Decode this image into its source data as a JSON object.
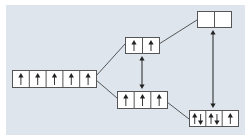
{
  "diagram": {
    "title": "",
    "colors": {
      "background": "#dfe5ec",
      "box_fill": "#ffffff",
      "stroke": "#555555",
      "arrow": "#222222"
    },
    "levels": [
      {
        "id": "free-ion",
        "x": 12,
        "y": 70,
        "w": 84,
        "h": 17,
        "cells": [
          "up",
          "up",
          "up",
          "up",
          "up"
        ]
      },
      {
        "id": "upper-middle",
        "x": 125,
        "y": 37,
        "w": 34,
        "h": 16,
        "cells": [
          "up",
          "up"
        ]
      },
      {
        "id": "lower-middle",
        "x": 117,
        "y": 91,
        "w": 50,
        "h": 17,
        "cells": [
          "up",
          "up",
          "up"
        ]
      },
      {
        "id": "upper-right",
        "x": 197,
        "y": 11,
        "w": 34,
        "h": 16,
        "cells": [
          "empty",
          "empty"
        ]
      },
      {
        "id": "lower-right",
        "x": 189,
        "y": 110,
        "w": 49,
        "h": 16,
        "cells": [
          "updown",
          "updown",
          "up"
        ]
      }
    ],
    "connectors": [
      {
        "from": "free-ion",
        "to": "upper-middle",
        "x1": 96,
        "y1": 76,
        "x2": 125,
        "y2": 44
      },
      {
        "from": "free-ion",
        "to": "lower-middle",
        "x1": 96,
        "y1": 80,
        "x2": 117,
        "y2": 98
      },
      {
        "from": "upper-middle",
        "to": "upper-right",
        "x1": 159,
        "y1": 44,
        "x2": 197,
        "y2": 20
      },
      {
        "from": "lower-middle",
        "to": "lower-right",
        "x1": 167,
        "y1": 102,
        "x2": 189,
        "y2": 119
      }
    ],
    "splitting_arrows": [
      {
        "label": "splitting-energy-1",
        "x": 142,
        "y1": 56,
        "y2": 89
      },
      {
        "label": "splitting-energy-2",
        "x": 213,
        "y1": 30,
        "y2": 108
      }
    ]
  }
}
